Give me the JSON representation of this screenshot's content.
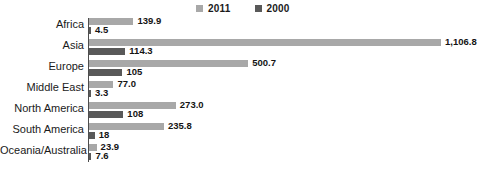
{
  "chart_data": {
    "type": "bar",
    "orientation": "horizontal",
    "title": "",
    "xlabel": "",
    "ylabel": "",
    "grid": false,
    "legend_position": "top-center",
    "categories": [
      "Africa",
      "Asia",
      "Europe",
      "Middle East",
      "North America",
      "South America",
      "Oceania/Australia"
    ],
    "series": [
      {
        "name": "2011",
        "color": "#a8a8a8",
        "values": [
          139.9,
          1106.8,
          500.7,
          77.0,
          273.0,
          235.8,
          23.9
        ],
        "labels": [
          "139.9",
          "1,106.8",
          "500.7",
          "77.0",
          "273.0",
          "235.8",
          "23.9"
        ]
      },
      {
        "name": "2000",
        "color": "#595959",
        "values": [
          4.5,
          114.3,
          105,
          3.3,
          108,
          18,
          7.6
        ],
        "labels": [
          "4.5",
          "114.3",
          "105",
          "3.3",
          "108",
          "18",
          "7.6"
        ]
      }
    ],
    "xlim": [
      0,
      1240
    ],
    "axis_color": "#4d4d4d"
  },
  "legend": {
    "items": [
      {
        "label": "2011",
        "color": "#a8a8a8"
      },
      {
        "label": "2000",
        "color": "#595959"
      }
    ]
  },
  "caption_fragment": ""
}
